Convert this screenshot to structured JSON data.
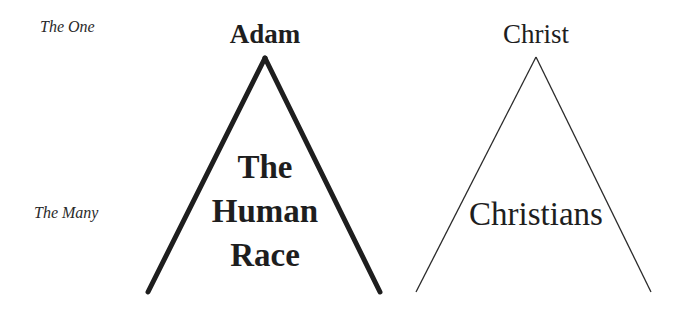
{
  "rows": {
    "top_label": "The One",
    "bottom_label": "The Many"
  },
  "triangles": [
    {
      "apex_label": "Adam",
      "inner_lines": [
        "The",
        "Human",
        "Race"
      ],
      "stroke": "bold",
      "color": "#1e1e1e"
    },
    {
      "apex_label": "Christ",
      "inner_lines": [
        "Christians"
      ],
      "stroke": "thin",
      "color": "#1e1e1e"
    }
  ]
}
